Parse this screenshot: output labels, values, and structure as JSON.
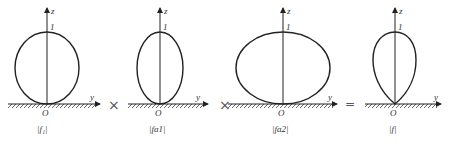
{
  "diagram": {
    "panels": [
      {
        "id": "f1",
        "axis_z": "z",
        "axis_y": "y",
        "origin": "O",
        "tick": "1",
        "label": "|f₁|",
        "shape": "circle"
      },
      {
        "id": "fa1",
        "axis_z": "z",
        "axis_y": "y",
        "origin": "O",
        "tick": "1",
        "label": "|fa1|",
        "shape": "tall-ellipse"
      },
      {
        "id": "fa2",
        "axis_z": "z",
        "axis_y": "y",
        "origin": "O",
        "tick": "1",
        "label": "|fa2|",
        "shape": "wide-ellipse"
      },
      {
        "id": "f",
        "axis_z": "z",
        "axis_y": "y",
        "origin": "O",
        "tick": "1",
        "label": "|f|",
        "shape": "pointed-lobe"
      }
    ],
    "operators": [
      "×",
      "×",
      "="
    ]
  }
}
